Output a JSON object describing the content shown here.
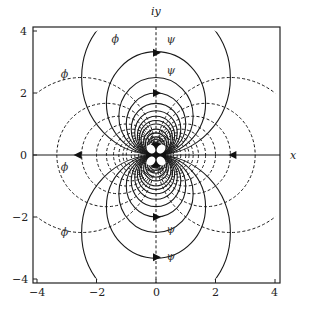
{
  "figure": {
    "x_axis_label": "x",
    "y_axis_label": "iy",
    "x_ticks": [
      "−4",
      "−2",
      "0",
      "2",
      "4"
    ],
    "y_ticks": [
      "4",
      "2",
      "0",
      "−2",
      "−4"
    ],
    "phi_label": "ϕ",
    "psi_label": "ψ",
    "clip_radius_sq": 20,
    "xlim": [
      -4.15,
      4.15
    ],
    "ylim": [
      -4.15,
      4.15
    ]
  },
  "chart_data": {
    "type": "contour",
    "title": "",
    "xlabel": "x",
    "ylabel": "iy",
    "xlim": [
      -4,
      4
    ],
    "ylim": [
      -4,
      4
    ],
    "x_ticks": [
      -4,
      -2,
      0,
      2,
      4
    ],
    "y_ticks": [
      -4,
      -2,
      0,
      2,
      4
    ],
    "grid": false,
    "series": [
      {
        "name": "psi (solid streamlines)",
        "equation": "y/(x^2+y^2) = c",
        "style": "solid",
        "levels": [
          0.2,
          0.3,
          0.4,
          0.5,
          0.6,
          0.7,
          0.8,
          0.9,
          1.0,
          1.2,
          1.4,
          1.7,
          2.0,
          2.5,
          3.3,
          5.0
        ]
      },
      {
        "name": "phi (dashed equipotentials)",
        "equation": "x/(x^2+y^2) = c",
        "style": "dashed",
        "levels": [
          0.2,
          0.3,
          0.4,
          0.5,
          0.6,
          0.7,
          0.8,
          0.9,
          1.0,
          1.2,
          1.4,
          1.7,
          2.0,
          2.5,
          3.3,
          5.0
        ]
      }
    ],
    "annotations": [
      {
        "text": "ψ",
        "x": 0.35,
        "y": 3.6
      },
      {
        "text": "ψ",
        "x": 0.35,
        "y": 2.6
      },
      {
        "text": "ψ",
        "x": 0.35,
        "y": -2.5
      },
      {
        "text": "ψ",
        "x": 0.35,
        "y": -3.4
      },
      {
        "text": "ϕ",
        "x": -1.5,
        "y": 3.6
      },
      {
        "text": "ϕ",
        "x": -3.2,
        "y": 2.5
      },
      {
        "text": "ϕ",
        "x": -3.2,
        "y": -0.5
      },
      {
        "text": "ϕ",
        "x": -3.2,
        "y": -2.6
      }
    ],
    "arrows": [
      {
        "x": -2.6,
        "y": 0,
        "direction": "left"
      },
      {
        "x": 2.6,
        "y": 0,
        "direction": "left"
      },
      {
        "x": 0,
        "y": 3.3,
        "direction": "right"
      },
      {
        "x": 0,
        "y": 2.0,
        "direction": "right"
      },
      {
        "x": 0,
        "y": -2.0,
        "direction": "right"
      },
      {
        "x": 0,
        "y": -3.3,
        "direction": "right"
      }
    ]
  }
}
